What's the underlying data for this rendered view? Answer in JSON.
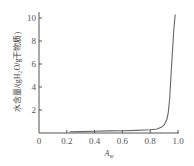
{
  "chart_data": {
    "type": "line",
    "title": "",
    "xlabel": "A_w",
    "xlabel_display": "Aw",
    "ylabel": "水含量/(gH₂O/g干物质)",
    "xlim": [
      0,
      1.0
    ],
    "ylim": [
      0,
      10.5
    ],
    "grid": false,
    "legend": null,
    "x_ticks": [
      "0",
      "0.2",
      "0.4",
      "0.6",
      "0.8",
      "1.0"
    ],
    "y_ticks": [
      "2",
      "4",
      "6",
      "8",
      "10"
    ],
    "series": [
      {
        "name": "water sorption isotherm",
        "x": [
          0.22,
          0.3,
          0.4,
          0.5,
          0.6,
          0.7,
          0.8,
          0.85,
          0.88,
          0.9,
          0.92,
          0.93,
          0.94,
          0.95,
          0.96,
          0.97,
          0.98
        ],
        "y": [
          0.1,
          0.12,
          0.15,
          0.18,
          0.2,
          0.23,
          0.28,
          0.35,
          0.5,
          0.7,
          1.2,
          1.8,
          3.0,
          5.0,
          7.0,
          9.0,
          10.3
        ]
      }
    ]
  }
}
